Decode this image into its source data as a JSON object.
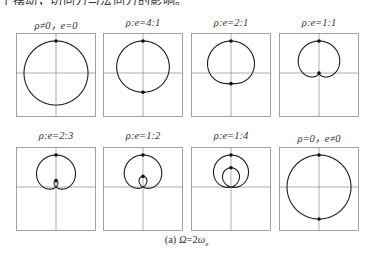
{
  "header_fragment": "于摆动，切向力与法向力的影响。",
  "panels": [
    {
      "title": "ρ≠0，e=0",
      "ratio": null,
      "rho": 1,
      "e": 0,
      "row": 0,
      "col": 0
    },
    {
      "title": "ρ:e=4:1",
      "ratio": "4:1",
      "rho": 4,
      "e": 1,
      "row": 0,
      "col": 1
    },
    {
      "title": "ρ:e=2:1",
      "ratio": "2:1",
      "rho": 2,
      "e": 1,
      "row": 0,
      "col": 2
    },
    {
      "title": "ρ:e=1:1",
      "ratio": "1:1",
      "rho": 1,
      "e": 1,
      "row": 0,
      "col": 3
    },
    {
      "title": "ρ:e=2:3",
      "ratio": "2:3",
      "rho": 2,
      "e": 3,
      "row": 1,
      "col": 0
    },
    {
      "title": "ρ:e=1:2",
      "ratio": "1:2",
      "rho": 1,
      "e": 2,
      "row": 1,
      "col": 1
    },
    {
      "title": "ρ:e=1:4",
      "ratio": "1:4",
      "rho": 1,
      "e": 4,
      "row": 1,
      "col": 2
    },
    {
      "title": "ρ=0，e≠0",
      "ratio": null,
      "rho": 0,
      "e": 1,
      "row": 1,
      "col": 3
    }
  ],
  "caption": {
    "label": "(a)",
    "omega": "Ω",
    "equals": "=2",
    "omega_e": "ω",
    "subscript": "e"
  },
  "colors": {
    "curve": "#1a1a1a",
    "axes": "#8a8a8a",
    "frame": "#8a8a8a",
    "marker": "#111111"
  }
}
